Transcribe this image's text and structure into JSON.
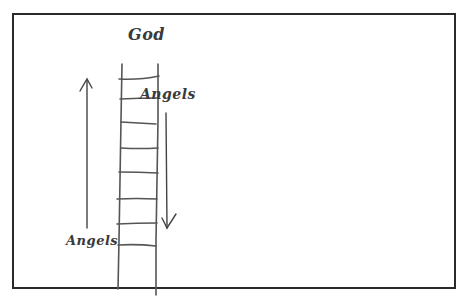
{
  "diagram": {
    "top_label": "God",
    "upper_angels_label": "Angels",
    "lower_angels_label": "Angels",
    "colors": {
      "stroke": "#4a4a4a",
      "frame": "#2a2a2a",
      "background": "#ffffff"
    },
    "elements": {
      "ladder": {
        "rungs": 9
      },
      "up_arrow": {
        "direction": "up"
      },
      "down_arrow": {
        "direction": "down"
      }
    }
  }
}
